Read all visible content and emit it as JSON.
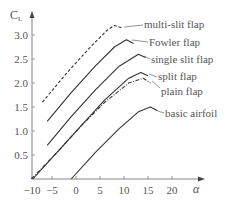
{
  "chart_data": {
    "type": "line",
    "title": "",
    "xlabel": "α",
    "ylabel": "C_L",
    "xlim": [
      -10,
      24
    ],
    "ylim": [
      0,
      3.3
    ],
    "x_ticks": [
      -10,
      -5,
      0,
      5,
      10,
      15,
      20
    ],
    "y_ticks": [
      0.5,
      1.0,
      1.5,
      2.0,
      2.5,
      3.0
    ],
    "x_tick_labels": [
      "−10",
      "−5",
      "0",
      "5",
      "10",
      "15",
      "20"
    ],
    "y_tick_labels": [
      "0.5",
      "1.0",
      "1.5",
      "2.0",
      "2.5",
      "3.0"
    ],
    "grid": false,
    "legend": "inline labels with leader lines",
    "series": [
      {
        "name": "multi-slit flap",
        "style": "dashed",
        "x": [
          -7,
          -2,
          3,
          6.5,
          8,
          9.5
        ],
        "y": [
          1.6,
          2.2,
          2.75,
          3.1,
          3.2,
          3.15
        ]
      },
      {
        "name": "Fowler flap",
        "style": "solid",
        "x": [
          -6,
          -1,
          4,
          8,
          10.5,
          12
        ],
        "y": [
          1.2,
          1.8,
          2.35,
          2.75,
          2.9,
          2.82
        ]
      },
      {
        "name": "single slit flap",
        "style": "solid",
        "x": [
          -6,
          -1,
          4,
          9,
          13,
          14.5
        ],
        "y": [
          0.7,
          1.3,
          1.85,
          2.35,
          2.6,
          2.53
        ]
      },
      {
        "name": "split flap",
        "style": "solid",
        "x": [
          -9,
          -4,
          1,
          6,
          11,
          13.5,
          15
        ],
        "y": [
          0,
          0.55,
          1.1,
          1.65,
          2.1,
          2.22,
          2.15
        ]
      },
      {
        "name": "plain flap",
        "style": "dash-dot",
        "x": [
          -9.3,
          -4,
          1,
          6,
          11,
          14,
          15.5
        ],
        "y": [
          0,
          0.55,
          1.1,
          1.6,
          2.0,
          2.1,
          2.0
        ]
      },
      {
        "name": "basic airfoil",
        "style": "solid",
        "x": [
          -1,
          4,
          9,
          13,
          15.5,
          17
        ],
        "y": [
          0,
          0.55,
          1.05,
          1.4,
          1.5,
          1.42
        ]
      }
    ]
  },
  "labels": {
    "y_axis": "C",
    "y_axis_sub": "L",
    "x_axis": "α",
    "series": [
      "multi-slit flap",
      "Fowler flap",
      "single slit flap",
      "split flap",
      "plain flap",
      "basic airfoil"
    ]
  }
}
